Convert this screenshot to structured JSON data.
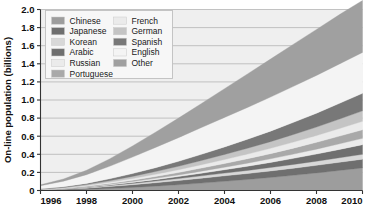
{
  "chart_data": {
    "type": "area",
    "title": "",
    "subtitle": "",
    "xlabel": "",
    "ylabel": "On-line population (billions)",
    "stacked": true,
    "grid": true,
    "legend_position": "top-left-inside",
    "xlim": [
      1996,
      2010
    ],
    "ylim": [
      0,
      2.0
    ],
    "xticks": [
      "1996",
      "1998",
      "2000",
      "2002",
      "2004",
      "2006",
      "2008",
      "2010"
    ],
    "xtick_values": [
      1996,
      1998,
      2000,
      2002,
      2004,
      2006,
      2008,
      2010
    ],
    "yticks": [
      "0",
      "0.2",
      "0.4",
      "0.6",
      "0.8",
      "1.0",
      "1.2",
      "1.4",
      "1.6",
      "1.8",
      "2.0"
    ],
    "ytick_values": [
      0,
      0.2,
      0.4,
      0.6,
      0.8,
      1.0,
      1.2,
      1.4,
      1.6,
      1.8,
      2.0
    ],
    "x": [
      1996,
      1997,
      1998,
      1999,
      2000,
      2001,
      2002,
      2003,
      2004,
      2005,
      2006,
      2007,
      2008,
      2009,
      2010
    ],
    "series": [
      {
        "name": "Chinese",
        "color": "#9d9d9d",
        "values": [
          0.002,
          0.006,
          0.012,
          0.022,
          0.034,
          0.048,
          0.064,
          0.082,
          0.102,
          0.122,
          0.144,
          0.168,
          0.194,
          0.222,
          0.25
        ]
      },
      {
        "name": "Japanese",
        "color": "#6f6f6f",
        "values": [
          0.004,
          0.008,
          0.014,
          0.022,
          0.03,
          0.038,
          0.046,
          0.054,
          0.06,
          0.066,
          0.072,
          0.078,
          0.084,
          0.09,
          0.096
        ]
      },
      {
        "name": "Korean",
        "color": "#d8d8d8",
        "values": [
          0.001,
          0.003,
          0.006,
          0.01,
          0.014,
          0.018,
          0.022,
          0.026,
          0.03,
          0.034,
          0.038,
          0.042,
          0.046,
          0.05,
          0.054
        ]
      },
      {
        "name": "Arabic",
        "color": "#6f6f6f",
        "values": [
          0.001,
          0.002,
          0.004,
          0.007,
          0.011,
          0.016,
          0.022,
          0.029,
          0.037,
          0.046,
          0.056,
          0.067,
          0.079,
          0.092,
          0.106
        ]
      },
      {
        "name": "Russian",
        "color": "#ebebeb",
        "values": [
          0.001,
          0.002,
          0.004,
          0.007,
          0.01,
          0.014,
          0.018,
          0.023,
          0.028,
          0.034,
          0.04,
          0.047,
          0.054,
          0.062,
          0.07
        ]
      },
      {
        "name": "Portuguese",
        "color": "#a9a9a9",
        "values": [
          0.001,
          0.003,
          0.006,
          0.01,
          0.015,
          0.021,
          0.027,
          0.034,
          0.041,
          0.049,
          0.057,
          0.066,
          0.075,
          0.085,
          0.095
        ]
      },
      {
        "name": "French",
        "color": "#ebebeb",
        "values": [
          0.002,
          0.004,
          0.008,
          0.013,
          0.018,
          0.024,
          0.03,
          0.037,
          0.044,
          0.051,
          0.059,
          0.067,
          0.075,
          0.084,
          0.093
        ]
      },
      {
        "name": "German",
        "color": "#c4c4c4",
        "values": [
          0.003,
          0.006,
          0.011,
          0.017,
          0.024,
          0.031,
          0.039,
          0.047,
          0.056,
          0.065,
          0.074,
          0.084,
          0.094,
          0.105,
          0.116
        ]
      },
      {
        "name": "Spanish",
        "color": "#787878",
        "values": [
          0.003,
          0.007,
          0.013,
          0.021,
          0.031,
          0.042,
          0.054,
          0.068,
          0.083,
          0.099,
          0.116,
          0.134,
          0.153,
          0.173,
          0.194
        ]
      },
      {
        "name": "English",
        "color": "#f4f4f4",
        "values": [
          0.035,
          0.062,
          0.097,
          0.138,
          0.182,
          0.224,
          0.262,
          0.296,
          0.326,
          0.352,
          0.376,
          0.398,
          0.418,
          0.436,
          0.452
        ]
      },
      {
        "name": "Other",
        "color": "#a0a0a0",
        "values": [
          0.01,
          0.024,
          0.048,
          0.082,
          0.123,
          0.168,
          0.216,
          0.266,
          0.318,
          0.37,
          0.42,
          0.466,
          0.508,
          0.545,
          0.574
        ]
      }
    ]
  },
  "legend": {
    "columns": [
      {
        "items": [
          {
            "label": "Chinese",
            "color": "#9d9d9d"
          },
          {
            "label": "Japanese",
            "color": "#6f6f6f"
          },
          {
            "label": "Korean",
            "color": "#d8d8d8"
          },
          {
            "label": "Arabic",
            "color": "#6f6f6f"
          },
          {
            "label": "Russian",
            "color": "#ebebeb"
          },
          {
            "label": "Portuguese",
            "color": "#a9a9a9"
          }
        ]
      },
      {
        "items": [
          {
            "label": "French",
            "color": "#ebebeb"
          },
          {
            "label": "German",
            "color": "#c4c4c4"
          },
          {
            "label": "Spanish",
            "color": "#787878"
          },
          {
            "label": "English",
            "color": "#f4f4f4"
          },
          {
            "label": "Other",
            "color": "#a0a0a0"
          }
        ]
      }
    ]
  },
  "style": {
    "plot_background": "#efefef",
    "grid_color": "#b4b4b4",
    "axis_color": "#333333",
    "legend_background": "#f7f7f7",
    "legend_border": "#bfbfbf",
    "page_background": "#ffffff"
  }
}
